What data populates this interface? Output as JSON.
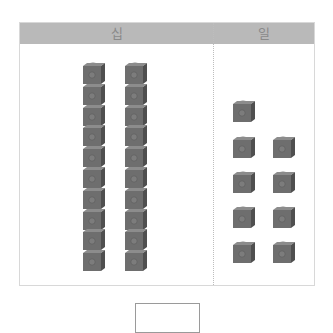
{
  "table": {
    "headers": {
      "tens": "십",
      "ones": "일"
    },
    "header_color": "#b9b9b9",
    "cube_color": "#6e6e6e"
  },
  "tens": {
    "rods": 2,
    "cubes_per_rod": 10
  },
  "ones": {
    "cubes": 9
  },
  "answer": {
    "value": ""
  }
}
